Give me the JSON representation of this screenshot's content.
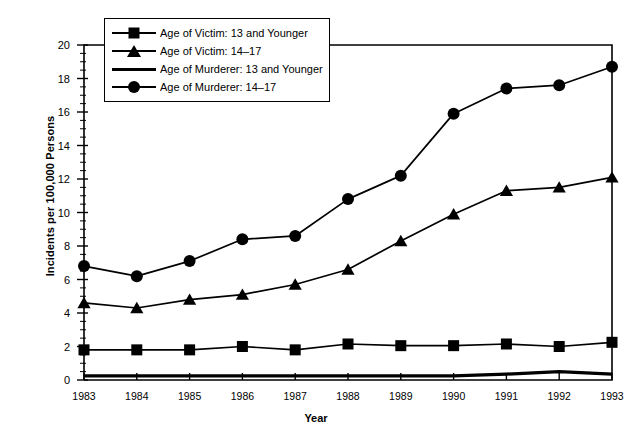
{
  "chart_data": {
    "type": "line",
    "title": "",
    "xlabel": "Year",
    "ylabel": "Incidents per 100,000 Persons",
    "categories": [
      "1983",
      "1984",
      "1985",
      "1986",
      "1987",
      "1988",
      "1989",
      "1990",
      "1991",
      "1992",
      "1993"
    ],
    "x": [
      1983,
      1984,
      1985,
      1986,
      1987,
      1988,
      1989,
      1990,
      1991,
      1992,
      1993
    ],
    "xlim": [
      1983,
      1993
    ],
    "ylim": [
      0,
      20
    ],
    "ytick_labels": [
      "0",
      "2",
      "4",
      "6",
      "8",
      "10",
      "12",
      "14",
      "16",
      "18",
      "20"
    ],
    "yticks": [
      0,
      2,
      4,
      6,
      8,
      10,
      12,
      14,
      16,
      18,
      20
    ],
    "y_minor_step": 0.5,
    "grid": false,
    "legend_position": "top-left",
    "series": [
      {
        "name": "Age of Victim: 13 and Younger",
        "marker": "square",
        "values": [
          1.8,
          1.8,
          1.8,
          2.0,
          1.8,
          2.15,
          2.05,
          2.05,
          2.15,
          2.0,
          2.25
        ]
      },
      {
        "name": "Age of Victim: 14–17",
        "marker": "triangle",
        "values": [
          4.6,
          4.3,
          4.8,
          5.1,
          5.7,
          6.6,
          8.3,
          9.9,
          11.3,
          11.5,
          12.1
        ]
      },
      {
        "name": "Age of Murderer: 13 and Younger",
        "marker": "none",
        "values": [
          0.25,
          0.25,
          0.25,
          0.25,
          0.25,
          0.25,
          0.25,
          0.25,
          0.35,
          0.5,
          0.35
        ]
      },
      {
        "name": "Age of Murderer: 14–17",
        "marker": "circle",
        "values": [
          6.8,
          6.2,
          7.1,
          8.4,
          8.6,
          10.8,
          12.2,
          15.9,
          17.4,
          17.6,
          18.7
        ]
      }
    ]
  },
  "legend": {
    "items": [
      {
        "label": "Age of Victim: 13 and Younger",
        "marker": "square"
      },
      {
        "label": "Age of Victim: 14–17",
        "marker": "triangle"
      },
      {
        "label": "Age of Murderer: 13 and Younger",
        "marker": "none"
      },
      {
        "label": "Age of Murderer: 14–17",
        "marker": "circle"
      }
    ]
  },
  "colors": {
    "ink": "#000000",
    "background": "#ffffff"
  }
}
